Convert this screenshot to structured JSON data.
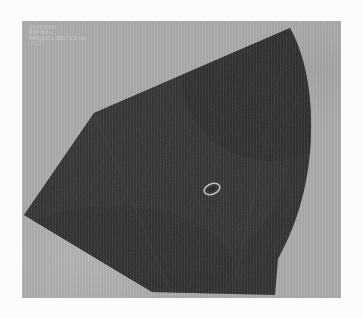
{
  "viewer": {
    "title": "Scan Viewer",
    "panel_name": "grayscale-scan-panel"
  },
  "colors": {
    "matte": "#fcfcfc",
    "panel_background": "#abacac",
    "dark_region": "#2e2e2e",
    "dark_region_edge": "#3a3a3a",
    "annotation_text": "#bdbdbd",
    "ring_marker": "#b9b9b9"
  },
  "annotation": {
    "name": "scan-annotation-overlay",
    "lines": [
      "SCAN 00482",
      "EXP  8.0 s",
      "RES 240 x 180 / 1.0 mm",
      "LVL  37"
    ]
  },
  "region": {
    "name": "dark-wedge-region",
    "description": "large dark wedge shaped region occupying most of the panel",
    "vertices_px": [
      [
        2,
        194
      ],
      [
        72,
        92
      ],
      [
        268,
        7
      ],
      [
        286,
        70
      ],
      [
        288,
        140
      ],
      [
        254,
        222
      ],
      [
        253,
        274
      ],
      [
        130,
        271
      ]
    ],
    "fill": "#2e2e2e"
  },
  "marker": {
    "name": "ring-marker",
    "shape": "ellipse-annulus",
    "center_px": [
      190,
      168
    ],
    "radius_x_px": 8,
    "radius_y_px": 5,
    "rotation_deg": -22,
    "stroke": "#b9b9b9"
  }
}
